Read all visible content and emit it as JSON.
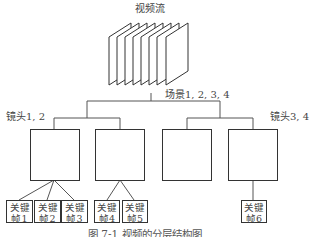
{
  "diagram": {
    "title": "视频流",
    "scene_label": "场景1, 2, 3, 4",
    "shot_group_left_label": "镜头1, 2",
    "shot_group_right_label": "镜头3, 4",
    "frame_count": 8,
    "shots": [
      {
        "id": "shot-1",
        "keyframes": [
          "kf1",
          "kf2",
          "kf3"
        ]
      },
      {
        "id": "shot-2",
        "keyframes": [
          "kf4",
          "kf5"
        ]
      },
      {
        "id": "shot-3",
        "keyframes": []
      },
      {
        "id": "shot-4",
        "keyframes": [
          "kf6"
        ]
      }
    ],
    "keyframes": [
      {
        "line1": "关键",
        "line2": "帧1"
      },
      {
        "line1": "关键",
        "line2": "帧2"
      },
      {
        "line1": "关键",
        "line2": "帧3"
      },
      {
        "line1": "关键",
        "line2": "帧4"
      },
      {
        "line1": "关键",
        "line2": "帧5"
      },
      {
        "line1": "关键",
        "line2": "帧6"
      }
    ],
    "caption": "图 7-1   视频的分层结构图",
    "colors": {
      "line": "#333333",
      "connector": "#555555",
      "background": "#ffffff"
    }
  }
}
